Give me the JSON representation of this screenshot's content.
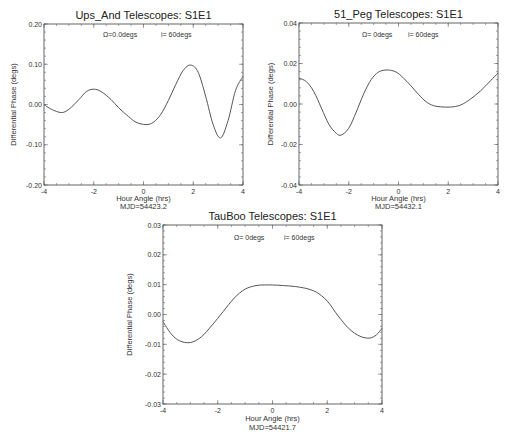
{
  "chart_data": [
    {
      "type": "line",
      "title": "Ups_And   Telescopes: S1E1",
      "annotation_omega": "Ω=0.0degs",
      "annotation_i": "i= 60degs",
      "xlabel": "Hour Angle (hrs)",
      "xlabel2": "MJD=54423.2",
      "ylabel": "Differential Phase (degs)",
      "xlim": [
        -4,
        4
      ],
      "ylim": [
        -0.2,
        0.2
      ],
      "xticks": [
        -4,
        -2,
        0,
        2,
        4
      ],
      "xtick_labels": [
        "-4",
        "-2",
        "0",
        "2",
        "4"
      ],
      "yticks": [
        -0.2,
        -0.1,
        0.0,
        0.1,
        0.2
      ],
      "ytick_labels": [
        "-0.20",
        "-0.10",
        "0.00",
        "0.10",
        "0.20"
      ],
      "grid": false,
      "box": {
        "left": 44,
        "top": 24,
        "right": 243,
        "bottom": 185
      },
      "series": [
        {
          "name": "Ups_And",
          "x": [
            -4.0,
            -3.7,
            -3.3,
            -3.0,
            -2.6,
            -2.3,
            -2.0,
            -1.7,
            -1.3,
            -1.0,
            -0.6,
            -0.3,
            0.1,
            0.4,
            0.7,
            1.0,
            1.3,
            1.6,
            1.9,
            2.2,
            2.5,
            2.8,
            3.1,
            3.4,
            3.7,
            4.0
          ],
          "y": [
            0.0,
            -0.012,
            -0.02,
            -0.012,
            0.012,
            0.032,
            0.038,
            0.032,
            0.012,
            -0.008,
            -0.03,
            -0.044,
            -0.05,
            -0.044,
            -0.024,
            0.01,
            0.05,
            0.085,
            0.098,
            0.08,
            0.02,
            -0.05,
            -0.083,
            -0.04,
            0.035,
            0.07
          ]
        }
      ]
    },
    {
      "type": "line",
      "title": "51_Peg   Telescopes: S1E1",
      "annotation_omega": "Ω=  0degs",
      "annotation_i": "i= 60degs",
      "xlabel": "Hour Angle (hrs)",
      "xlabel2": "MJD=54432.1",
      "ylabel": "Differential Phase (degs)",
      "xlim": [
        -4,
        4
      ],
      "ylim": [
        -0.04,
        0.04
      ],
      "xticks": [
        -4,
        -2,
        0,
        2,
        4
      ],
      "xtick_labels": [
        "-4",
        "-2",
        "0",
        "2",
        "4"
      ],
      "yticks": [
        -0.04,
        -0.02,
        0.0,
        0.02,
        0.04
      ],
      "ytick_labels": [
        "-0.04",
        "-0.02",
        "0.00",
        "0.02",
        "0.04"
      ],
      "grid": false,
      "box": {
        "left": 299,
        "top": 23,
        "right": 498,
        "bottom": 185
      },
      "series": [
        {
          "name": "51_Peg",
          "x": [
            -4.0,
            -3.7,
            -3.4,
            -3.1,
            -2.8,
            -2.5,
            -2.3,
            -2.0,
            -1.7,
            -1.4,
            -1.1,
            -0.8,
            -0.45,
            -0.1,
            0.2,
            0.5,
            0.8,
            1.1,
            1.4,
            1.7,
            2.1,
            2.5,
            2.9,
            3.3,
            3.7,
            4.0
          ],
          "y": [
            0.0128,
            0.011,
            0.006,
            -0.002,
            -0.01,
            -0.0145,
            -0.0153,
            -0.012,
            -0.004,
            0.005,
            0.012,
            0.0158,
            0.0168,
            0.0158,
            0.0128,
            0.009,
            0.0048,
            0.0012,
            -0.0008,
            -0.0014,
            -0.0015,
            -0.0005,
            0.0025,
            0.0065,
            0.0115,
            0.0153
          ]
        }
      ]
    },
    {
      "type": "line",
      "title": "TauBoo   Telescopes: S1E1",
      "annotation_omega": "Ω=  0degs",
      "annotation_i": "i= 60degs",
      "xlabel": "Hour Angle (hrs)",
      "xlabel2": "MJD=54421.7",
      "ylabel": "Differential Phase (degs)",
      "xlim": [
        -4,
        4
      ],
      "ylim": [
        -0.03,
        0.03
      ],
      "xticks": [
        -4,
        -2,
        0,
        2,
        4
      ],
      "xtick_labels": [
        "-4",
        "-2",
        "0",
        "2",
        "4"
      ],
      "yticks": [
        -0.03,
        -0.02,
        -0.01,
        0.0,
        0.01,
        0.02,
        0.03
      ],
      "ytick_labels": [
        "-0.03",
        "-0.02",
        "-0.01",
        "0.00",
        "0.01",
        "0.02",
        "0.03"
      ],
      "grid": false,
      "box": {
        "left": 163,
        "top": 225,
        "right": 382,
        "bottom": 404
      },
      "series": [
        {
          "name": "TauBoo",
          "x": [
            -4.0,
            -3.7,
            -3.4,
            -3.0,
            -2.6,
            -2.2,
            -1.8,
            -1.4,
            -1.0,
            -0.6,
            -0.3,
            0.0,
            0.4,
            0.8,
            1.2,
            1.6,
            2.0,
            2.4,
            2.8,
            3.2,
            3.55,
            3.8,
            4.0
          ],
          "y": [
            -0.0024,
            -0.0065,
            -0.0088,
            -0.0094,
            -0.0075,
            -0.0035,
            0.001,
            0.0055,
            0.0085,
            0.0097,
            0.0099,
            0.0099,
            0.0097,
            0.0094,
            0.0088,
            0.0075,
            0.0045,
            -0.0005,
            -0.0048,
            -0.0073,
            -0.0079,
            -0.0068,
            -0.0046
          ]
        }
      ]
    }
  ]
}
